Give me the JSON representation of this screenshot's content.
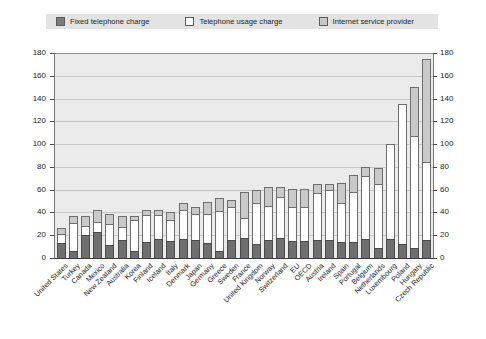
{
  "legend": {
    "items": [
      {
        "label": "Fixed telephone charge",
        "color": "#7b7b7b",
        "key": "fixed"
      },
      {
        "label": "Telephone usage charge",
        "color": "#ffffff",
        "key": "usage"
      },
      {
        "label": "Internet service provider",
        "color": "#c9c9c9",
        "key": "isp"
      }
    ]
  },
  "chart_data": {
    "type": "bar",
    "stacked": true,
    "title": "",
    "xlabel": "",
    "ylabel": "",
    "ylim": [
      0,
      180
    ],
    "ytick_values": [
      0,
      20,
      40,
      60,
      80,
      100,
      120,
      140,
      160,
      180
    ],
    "ytick_labels_left": [
      "0",
      "20",
      "40",
      "60",
      "80",
      "100",
      "120",
      "140",
      "160",
      "180"
    ],
    "ytick_labels_right": [
      "0",
      "20",
      "40",
      "60",
      "80",
      "100",
      "120",
      "140",
      "160",
      "180"
    ],
    "grid": true,
    "legend_position": "top",
    "categories": [
      "United States",
      "Turkey",
      "Canada",
      "Mexico",
      "New Zealand",
      "Australia",
      "Korea",
      "Finland",
      "Iceland",
      "Italy",
      "Denmark",
      "Japan",
      "Germany",
      "Greece",
      "Sweden",
      "France",
      "United Kingdom",
      "Norway",
      "Switzerland",
      "EU",
      "OECD",
      "Austria",
      "Ireland",
      "Spain",
      "Portugal",
      "Belgium",
      "Netherlands",
      "Luxembourg",
      "Poland",
      "Hungary",
      "Czech Republic"
    ],
    "series": [
      {
        "name": "Fixed telephone charge",
        "color": "#6f6f6f",
        "values": [
          13,
          6,
          20,
          23,
          11,
          16,
          6,
          14,
          17,
          15,
          17,
          16,
          13,
          6,
          16,
          18,
          12,
          16,
          18,
          15,
          15,
          16,
          16,
          14,
          14,
          17,
          9,
          17,
          12,
          9,
          16
        ]
      },
      {
        "name": "Telephone usage charge",
        "color": "#ffffff",
        "values": [
          8,
          25,
          8,
          9,
          19,
          11,
          27,
          24,
          21,
          18,
          25,
          23,
          26,
          35,
          29,
          17,
          36,
          30,
          36,
          30,
          30,
          41,
          44,
          34,
          44,
          55,
          56,
          83,
          123,
          98,
          68
        ]
      },
      {
        "name": "Internet service provider",
        "color": "#c9c9c9",
        "values": [
          5,
          6,
          9,
          10,
          9,
          10,
          4,
          4,
          4,
          7,
          6,
          6,
          10,
          12,
          6,
          23,
          12,
          16,
          8,
          16,
          16,
          8,
          5,
          18,
          15,
          8,
          14,
          0,
          0,
          43,
          91
        ]
      }
    ]
  }
}
